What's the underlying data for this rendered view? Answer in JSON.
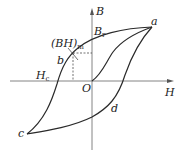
{
  "diagram": {
    "type": "hysteresis-loop",
    "axes": {
      "x_label": "H",
      "y_label": "B",
      "origin_label": "O"
    },
    "points": {
      "a": "a",
      "b": "b",
      "c": "c",
      "d": "d"
    },
    "annotations": {
      "remanence": {
        "main": "B",
        "sub": "r"
      },
      "coercivity": {
        "main": "H",
        "sub": "c"
      },
      "max_energy_product": {
        "main": "(BH)",
        "sub": "m"
      }
    },
    "colors": {
      "curve": "#2a2a2a",
      "axis": "#555555",
      "dashed": "#333333",
      "background": "#ffffff"
    }
  }
}
